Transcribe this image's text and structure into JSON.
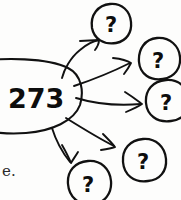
{
  "diagram": {
    "style": "hand-drawn sketch",
    "ink_color": "#111111",
    "background_color": "#fdfdfc",
    "source_node": {
      "label": "273",
      "shape": "ellipse",
      "cropped_at_left_edge": true
    },
    "unknown_label": "?",
    "targets": [
      {
        "id": "bubble-top",
        "label": "?",
        "position": "top"
      },
      {
        "id": "bubble-upper-right",
        "label": "?",
        "position": "upper-right"
      },
      {
        "id": "bubble-right",
        "label": "?",
        "position": "right"
      },
      {
        "id": "bubble-lower-right",
        "label": "?",
        "position": "lower-right"
      },
      {
        "id": "bubble-bottom",
        "label": "?",
        "position": "bottom"
      }
    ],
    "arrows": [
      {
        "id": "arrow-to-top",
        "from": "273",
        "to": "bubble-top"
      },
      {
        "id": "arrow-to-upper-right",
        "from": "273",
        "to": "bubble-upper-right"
      },
      {
        "id": "arrow-to-right",
        "from": "273",
        "to": "bubble-right"
      },
      {
        "id": "arrow-to-lower-right",
        "from": "273",
        "to": "bubble-lower-right"
      },
      {
        "id": "arrow-to-bottom",
        "from": "273",
        "to": "bubble-bottom"
      }
    ],
    "margin_text": "e."
  }
}
